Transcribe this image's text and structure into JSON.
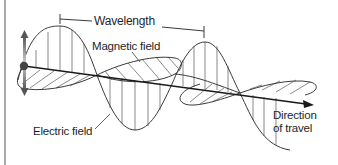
{
  "diagram": {
    "labels": {
      "wavelength": "Wavelength",
      "magnetic_field": "Magnetic field",
      "electric_field": "Electric field",
      "direction_line1": "Direction",
      "direction_line2": "of travel"
    },
    "colors": {
      "line": "#3a3a3a",
      "text": "#1f1f1f",
      "arrow_gradient_center": "#555555",
      "arrow_gradient_end": "#bbbbbb"
    }
  }
}
